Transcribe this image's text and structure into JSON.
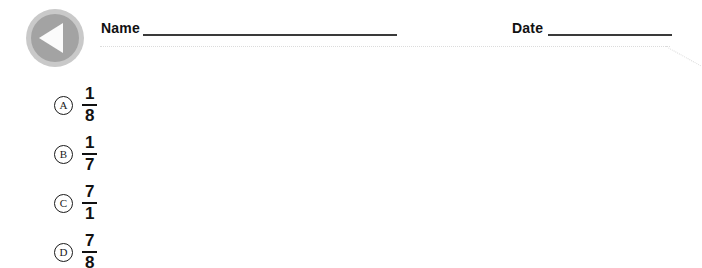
{
  "header": {
    "nav_icon": "back-triangle-icon",
    "name_label": "Name",
    "date_label": "Date",
    "name_value": "",
    "date_value": "",
    "rule_color": "#3a3a3a",
    "dotted_color": "#dcdcdc"
  },
  "choices": [
    {
      "letter": "A",
      "numerator": "1",
      "denominator": "8"
    },
    {
      "letter": "B",
      "numerator": "1",
      "denominator": "7"
    },
    {
      "letter": "C",
      "numerator": "7",
      "denominator": "1"
    },
    {
      "letter": "D",
      "numerator": "7",
      "denominator": "8"
    }
  ],
  "colors": {
    "background": "#ffffff",
    "icon_outer": "#c9c9c9",
    "icon_inner": "#a3a3a3",
    "icon_triangle": "#fbfbfb",
    "text": "#111111"
  }
}
